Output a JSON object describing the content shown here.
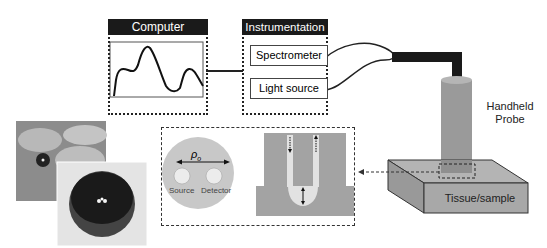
{
  "computer": {
    "title": "Computer"
  },
  "instrumentation": {
    "title": "Instrumentation",
    "spectrometer": "Spectrometer",
    "light_source": "Light source"
  },
  "probe": {
    "label_line1": "Handheld",
    "label_line2": "Probe"
  },
  "tissue": {
    "label": "Tissue/sample"
  },
  "inset": {
    "rho": "ρ",
    "rho_sub": "o",
    "source": "Source",
    "detector": "Detector"
  },
  "colors": {
    "dark": "#1a1a1a",
    "probe_gray": "#9a9a9a",
    "tissue_gray": "#a8a8a8",
    "light_gray": "#d8d8d8"
  }
}
